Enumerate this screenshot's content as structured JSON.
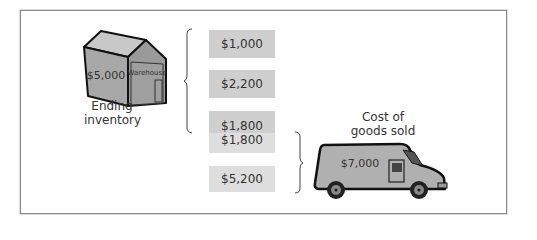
{
  "warehouse": {
    "value": "$5,000",
    "sign": "Warehouse",
    "caption_line1": "Ending",
    "caption_line2": "inventory"
  },
  "boxes": [
    {
      "value": "$1,000",
      "shade": "dark"
    },
    {
      "value": "$2,200",
      "shade": "dark"
    },
    {
      "value": "$1,800",
      "shade": "dark"
    },
    {
      "value": "$1,800",
      "shade": "light"
    },
    {
      "value": "$5,200",
      "shade": "light"
    }
  ],
  "van": {
    "value": "$7,000",
    "caption_line1": "Cost of",
    "caption_line2": "goods sold"
  },
  "colors": {
    "box_dark": "#cfcfcf",
    "box_light": "#dedede",
    "building_gray": "#a8a8a8",
    "van_gray": "#b0b0b0"
  }
}
